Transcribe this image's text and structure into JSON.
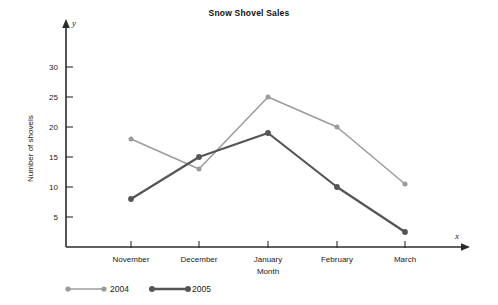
{
  "chart_data": {
    "type": "line",
    "title": "Snow Shovel Sales",
    "xlabel": "Month",
    "ylabel": "Number of shovels",
    "x_axis_name": "x",
    "y_axis_name": "y",
    "categories": [
      "November",
      "December",
      "January",
      "February",
      "March"
    ],
    "yticks": [
      5,
      10,
      15,
      20,
      25,
      30
    ],
    "ylim": [
      0,
      34
    ],
    "grid": false,
    "legend_position": "bottom-left",
    "series": [
      {
        "name": "2004",
        "color": "#9b9b9b",
        "values": [
          18,
          13,
          25,
          20,
          10.5
        ]
      },
      {
        "name": "2005",
        "color": "#555555",
        "values": [
          8,
          15,
          19,
          10,
          2.5
        ]
      }
    ]
  },
  "legend": {
    "items": [
      {
        "label": "2004"
      },
      {
        "label": "2005"
      }
    ]
  },
  "axes": {
    "y_tick_labels": [
      "30",
      "25",
      "20",
      "15",
      "10",
      "5"
    ],
    "x_tick_labels": [
      "November",
      "December",
      "January",
      "February",
      "March"
    ]
  }
}
